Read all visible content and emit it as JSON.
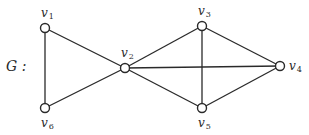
{
  "graph": {
    "name": "G",
    "name_label": "G :",
    "nodes": [
      {
        "id": "v1",
        "base": "v",
        "sub": "1",
        "x": 45,
        "y": 28,
        "lx": 41,
        "ly": 17
      },
      {
        "id": "v2",
        "base": "v",
        "sub": "2",
        "x": 125,
        "y": 68,
        "lx": 121,
        "ly": 57
      },
      {
        "id": "v3",
        "base": "v",
        "sub": "3",
        "x": 202,
        "y": 26,
        "lx": 198,
        "ly": 15
      },
      {
        "id": "v4",
        "base": "v",
        "sub": "4",
        "x": 280,
        "y": 66,
        "lx": 289,
        "ly": 70
      },
      {
        "id": "v5",
        "base": "v",
        "sub": "5",
        "x": 202,
        "y": 108,
        "lx": 198,
        "ly": 127
      },
      {
        "id": "v6",
        "base": "v",
        "sub": "6",
        "x": 45,
        "y": 108,
        "lx": 41,
        "ly": 127
      }
    ],
    "edges": [
      [
        "v1",
        "v6"
      ],
      [
        "v1",
        "v2"
      ],
      [
        "v6",
        "v2"
      ],
      [
        "v2",
        "v3"
      ],
      [
        "v2",
        "v4"
      ],
      [
        "v2",
        "v5"
      ],
      [
        "v3",
        "v4"
      ],
      [
        "v3",
        "v5"
      ],
      [
        "v5",
        "v4"
      ]
    ]
  }
}
